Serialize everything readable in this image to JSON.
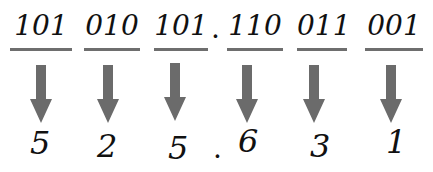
{
  "binary_groups": [
    "101",
    "010",
    "101",
    "110",
    "011",
    "001"
  ],
  "octal_digits": [
    "5",
    "2",
    "5",
    "6",
    "3",
    "1"
  ],
  "radix_point": ".",
  "colors": {
    "text": "#111111",
    "arrow": "#6b6b6b",
    "underline": "#6e6e6e"
  }
}
